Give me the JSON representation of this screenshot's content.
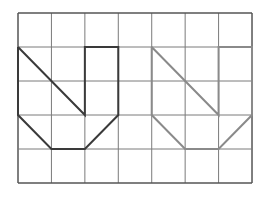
{
  "diagram": {
    "type": "grid-figures",
    "grid": {
      "columns": 7,
      "rows": 5,
      "origin_px": [
        18,
        13
      ],
      "cell_w": 33.43,
      "cell_h": 34,
      "line_color": "#7a7a7a",
      "border_color": "#555555"
    },
    "shapes": [
      {
        "name": "original-shape",
        "stroke": "#3a3a3a",
        "stroke_width": 2,
        "outline": [
          [
            0,
            1
          ],
          [
            0,
            3
          ],
          [
            1,
            4
          ],
          [
            2,
            4
          ],
          [
            3,
            3
          ],
          [
            3,
            1
          ],
          [
            2,
            1
          ],
          [
            2,
            3
          ],
          [
            0,
            1
          ]
        ]
      },
      {
        "name": "copied-shape",
        "stroke": "#8a8a8a",
        "stroke_width": 2,
        "outline": [
          [
            4,
            1
          ],
          [
            4,
            3
          ],
          [
            5,
            4
          ],
          [
            6,
            4
          ],
          [
            7,
            3
          ],
          [
            7,
            1
          ],
          [
            6,
            1
          ],
          [
            6,
            3
          ],
          [
            4,
            1
          ]
        ]
      }
    ]
  }
}
